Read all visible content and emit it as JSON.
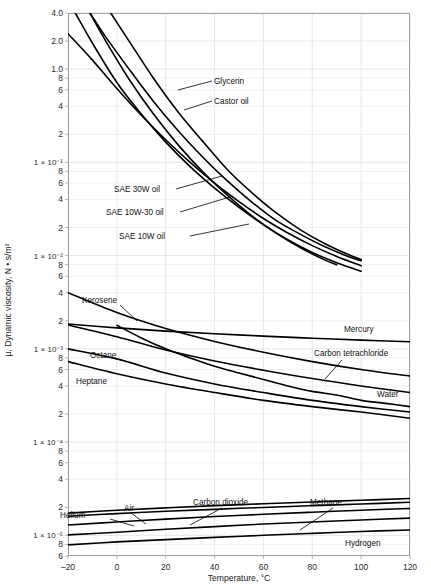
{
  "chart_data": {
    "type": "line",
    "title": "",
    "xlabel": "Temperature, °C",
    "ylabel": "μ, Dynamic viscosity, N • s/m²",
    "xlim": [
      -20,
      120
    ],
    "ylim": [
      6e-06,
      4.0
    ],
    "yscale": "log",
    "xscale": "linear",
    "grid": true,
    "legend_position": "inline-annotations",
    "x_ticks": [
      {
        "value": -20,
        "label": "–20"
      },
      {
        "value": 0,
        "label": "0"
      },
      {
        "value": 20,
        "label": "20"
      },
      {
        "value": 40,
        "label": "40"
      },
      {
        "value": 60,
        "label": "60"
      },
      {
        "value": 80,
        "label": "80"
      },
      {
        "value": 100,
        "label": "100"
      },
      {
        "value": 120,
        "label": "120"
      }
    ],
    "y_ticks": [
      {
        "value": 4.0,
        "label": "4.0",
        "major": true
      },
      {
        "value": 2.0,
        "label": "2.0",
        "major": true
      },
      {
        "value": 1.0,
        "label": "1.0",
        "major": true
      },
      {
        "value": 0.8,
        "label": "8",
        "major": false
      },
      {
        "value": 0.6,
        "label": "6",
        "major": false
      },
      {
        "value": 0.4,
        "label": "4",
        "major": false
      },
      {
        "value": 0.2,
        "label": "2",
        "major": false
      },
      {
        "value": 0.1,
        "label": "1 × 10⁻¹",
        "major": true
      },
      {
        "value": 0.08,
        "label": "8",
        "major": false
      },
      {
        "value": 0.06,
        "label": "6",
        "major": false
      },
      {
        "value": 0.04,
        "label": "4",
        "major": false
      },
      {
        "value": 0.02,
        "label": "2",
        "major": false
      },
      {
        "value": 0.01,
        "label": "1 × 10⁻²",
        "major": true
      },
      {
        "value": 0.008,
        "label": "8",
        "major": false
      },
      {
        "value": 0.006,
        "label": "6",
        "major": false
      },
      {
        "value": 0.004,
        "label": "4",
        "major": false
      },
      {
        "value": 0.002,
        "label": "2",
        "major": false
      },
      {
        "value": 0.001,
        "label": "1 × 10⁻³",
        "major": true
      },
      {
        "value": 0.0008,
        "label": "8",
        "major": false
      },
      {
        "value": 0.0006,
        "label": "6",
        "major": false
      },
      {
        "value": 0.0004,
        "label": "4",
        "major": false
      },
      {
        "value": 0.0002,
        "label": "2",
        "major": false
      },
      {
        "value": 0.0001,
        "label": "1 × 10⁻⁴",
        "major": true
      },
      {
        "value": 8e-05,
        "label": "8",
        "major": false
      },
      {
        "value": 6e-05,
        "label": "6",
        "major": false
      },
      {
        "value": 4e-05,
        "label": "4",
        "major": false
      },
      {
        "value": 2e-05,
        "label": "2",
        "major": false
      },
      {
        "value": 1e-05,
        "label": "1 × 10⁻⁵",
        "major": true
      },
      {
        "value": 8e-06,
        "label": "8",
        "major": false
      },
      {
        "value": 6e-06,
        "label": "6",
        "major": false
      }
    ],
    "series": [
      {
        "name": "Glycerin",
        "points": [
          [
            -2.5,
            4.0
          ],
          [
            5,
            2.0
          ],
          [
            15,
            0.8
          ],
          [
            25,
            0.35
          ],
          [
            35,
            0.17
          ],
          [
            45,
            0.085
          ],
          [
            55,
            0.048
          ],
          [
            65,
            0.029
          ],
          [
            75,
            0.019
          ],
          [
            85,
            0.0135
          ],
          [
            95,
            0.0102
          ],
          [
            100,
            0.0091
          ]
        ]
      },
      {
        "name": "Castor oil",
        "points": [
          [
            -11,
            4.0
          ],
          [
            -5,
            2.3
          ],
          [
            5,
            1.0
          ],
          [
            15,
            0.45
          ],
          [
            25,
            0.22
          ],
          [
            35,
            0.115
          ],
          [
            45,
            0.064
          ],
          [
            55,
            0.038
          ],
          [
            65,
            0.024
          ],
          [
            75,
            0.017
          ],
          [
            85,
            0.0125
          ],
          [
            95,
            0.0097
          ],
          [
            100,
            0.0088
          ]
        ]
      },
      {
        "name": "SAE 30W oil",
        "points": [
          [
            -20,
            2.4
          ],
          [
            -10,
            1.25
          ],
          [
            0,
            0.62
          ],
          [
            10,
            0.32
          ],
          [
            20,
            0.175
          ],
          [
            30,
            0.1
          ],
          [
            40,
            0.06
          ],
          [
            50,
            0.038
          ],
          [
            60,
            0.025
          ],
          [
            70,
            0.0175
          ],
          [
            80,
            0.0128
          ],
          [
            90,
            0.0098
          ],
          [
            100,
            0.0078
          ]
        ]
      },
      {
        "name": "SAE 10W-30 oil",
        "points": [
          [
            -17,
            4.0
          ],
          [
            -10,
            1.9
          ],
          [
            0,
            0.72
          ],
          [
            10,
            0.33
          ],
          [
            20,
            0.165
          ],
          [
            30,
            0.09
          ],
          [
            40,
            0.053
          ],
          [
            50,
            0.033
          ],
          [
            60,
            0.0215
          ],
          [
            70,
            0.0148
          ],
          [
            80,
            0.0108
          ],
          [
            90,
            0.0084
          ],
          [
            100,
            0.0068
          ]
        ]
      },
      {
        "name": "SAE 10W oil",
        "points": [
          [
            -11,
            4.0
          ],
          [
            -5,
            2.1
          ],
          [
            5,
            0.78
          ],
          [
            15,
            0.33
          ],
          [
            25,
            0.155
          ],
          [
            35,
            0.08
          ],
          [
            45,
            0.045
          ],
          [
            55,
            0.027
          ],
          [
            65,
            0.0175
          ],
          [
            75,
            0.0122
          ],
          [
            85,
            0.009
          ],
          [
            90,
            0.008
          ]
        ]
      },
      {
        "name": "Mercury",
        "points": [
          [
            -20,
            0.00185
          ],
          [
            0,
            0.00168
          ],
          [
            20,
            0.00155
          ],
          [
            40,
            0.00145
          ],
          [
            60,
            0.00137
          ],
          [
            80,
            0.0013
          ],
          [
            100,
            0.00124
          ],
          [
            120,
            0.00119
          ]
        ]
      },
      {
        "name": "Kerosene",
        "points": [
          [
            -20,
            0.004
          ],
          [
            0,
            0.00245
          ],
          [
            20,
            0.00165
          ],
          [
            40,
            0.0012
          ],
          [
            60,
            0.00092
          ],
          [
            80,
            0.00073
          ],
          [
            100,
            0.0006
          ],
          [
            120,
            0.00051
          ]
        ]
      },
      {
        "name": "Carbon tetrachloride",
        "points": [
          [
            -20,
            0.0018
          ],
          [
            0,
            0.00135
          ],
          [
            20,
            0.00097
          ],
          [
            40,
            0.00074
          ],
          [
            60,
            0.00059
          ],
          [
            80,
            0.00048
          ],
          [
            100,
            0.0004
          ],
          [
            120,
            0.00034
          ]
        ]
      },
      {
        "name": "Octane",
        "points": [
          [
            -20,
            0.001
          ],
          [
            0,
            0.00078
          ],
          [
            20,
            0.00055
          ],
          [
            40,
            0.00042
          ],
          [
            60,
            0.00034
          ],
          [
            80,
            0.00028
          ],
          [
            100,
            0.00024
          ],
          [
            120,
            0.00021
          ]
        ]
      },
      {
        "name": "Heptane",
        "points": [
          [
            -20,
            0.00073
          ],
          [
            0,
            0.00054
          ],
          [
            20,
            0.00042
          ],
          [
            40,
            0.00034
          ],
          [
            60,
            0.00028
          ],
          [
            80,
            0.00024
          ],
          [
            100,
            0.00021
          ],
          [
            120,
            0.00018
          ]
        ]
      },
      {
        "name": "Water",
        "points": [
          [
            0,
            0.00179
          ],
          [
            10,
            0.00131
          ],
          [
            20,
            0.001
          ],
          [
            30,
            0.0008
          ],
          [
            40,
            0.00065
          ],
          [
            50,
            0.00055
          ],
          [
            60,
            0.00047
          ],
          [
            70,
            0.0004
          ],
          [
            80,
            0.00035
          ],
          [
            90,
            0.00032
          ],
          [
            100,
            0.00028
          ],
          [
            110,
            0.00026
          ],
          [
            120,
            0.00024
          ]
        ]
      },
      {
        "name": "Methane",
        "points": [
          [
            -20,
            1.01e-05
          ],
          [
            0,
            1.08e-05
          ],
          [
            20,
            1.16e-05
          ],
          [
            40,
            1.24e-05
          ],
          [
            60,
            1.32e-05
          ],
          [
            80,
            1.39e-05
          ],
          [
            100,
            1.46e-05
          ],
          [
            120,
            1.53e-05
          ]
        ]
      },
      {
        "name": "Carbon dioxide",
        "points": [
          [
            -20,
            1.29e-05
          ],
          [
            0,
            1.39e-05
          ],
          [
            20,
            1.49e-05
          ],
          [
            40,
            1.59e-05
          ],
          [
            60,
            1.68e-05
          ],
          [
            80,
            1.77e-05
          ],
          [
            100,
            1.86e-05
          ],
          [
            120,
            1.94e-05
          ]
        ]
      },
      {
        "name": "Air",
        "points": [
          [
            -20,
            1.6e-05
          ],
          [
            0,
            1.71e-05
          ],
          [
            20,
            1.81e-05
          ],
          [
            40,
            1.9e-05
          ],
          [
            60,
            1.99e-05
          ],
          [
            80,
            2.08e-05
          ],
          [
            100,
            2.17e-05
          ],
          [
            120,
            2.26e-05
          ]
        ]
      },
      {
        "name": "Helium",
        "points": [
          [
            -20,
            1.73e-05
          ],
          [
            0,
            1.86e-05
          ],
          [
            20,
            1.97e-05
          ],
          [
            40,
            2.08e-05
          ],
          [
            60,
            2.18e-05
          ],
          [
            80,
            2.28e-05
          ],
          [
            100,
            2.38e-05
          ],
          [
            120,
            2.48e-05
          ]
        ]
      },
      {
        "name": "Hydrogen",
        "points": [
          [
            -20,
            7.9e-06
          ],
          [
            0,
            8.5e-06
          ],
          [
            20,
            9e-06
          ],
          [
            40,
            9.5e-06
          ],
          [
            60,
            1e-05
          ],
          [
            80,
            1.05e-05
          ],
          [
            100,
            1.1e-05
          ],
          [
            120,
            1.14e-05
          ]
        ]
      }
    ],
    "annotations": [
      {
        "text": "Glycerin",
        "x": 214,
        "y": 84,
        "anchor": "start"
      },
      {
        "text": "Castor oil",
        "x": 214,
        "y": 104,
        "anchor": "start"
      },
      {
        "text": "SAE 30W oil",
        "x": 114,
        "y": 192,
        "anchor": "start"
      },
      {
        "text": "SAE 10W-30 oil",
        "x": 106,
        "y": 215,
        "anchor": "start"
      },
      {
        "text": "SAE 10W oil",
        "x": 119,
        "y": 239,
        "anchor": "start"
      },
      {
        "text": "Kerosene",
        "x": 82,
        "y": 303,
        "anchor": "start"
      },
      {
        "text": "Mercury",
        "x": 344,
        "y": 332,
        "anchor": "start"
      },
      {
        "text": "Carbon tetrachloride",
        "x": 314,
        "y": 356,
        "anchor": "start"
      },
      {
        "text": "Octane",
        "x": 90,
        "y": 358,
        "anchor": "start"
      },
      {
        "text": "Heptane",
        "x": 76,
        "y": 384,
        "anchor": "start"
      },
      {
        "text": "Water",
        "x": 377,
        "y": 397,
        "anchor": "start"
      },
      {
        "text": "Helium",
        "x": 60,
        "y": 518,
        "anchor": "start"
      },
      {
        "text": "Air",
        "x": 124,
        "y": 511,
        "anchor": "start"
      },
      {
        "text": "Carbon dioxide",
        "x": 193,
        "y": 505,
        "anchor": "start"
      },
      {
        "text": "Methane",
        "x": 310,
        "y": 505,
        "anchor": "start"
      },
      {
        "text": "Hydrogen",
        "x": 345,
        "y": 546,
        "anchor": "start"
      }
    ],
    "leader_lines": [
      {
        "from": [
          212,
          81
        ],
        "to": [
          178,
          90
        ]
      },
      {
        "from": [
          212,
          101
        ],
        "to": [
          184,
          110
        ]
      },
      {
        "from": [
          176,
          189
        ],
        "to": [
          222,
          176
        ]
      },
      {
        "from": [
          180,
          212
        ],
        "to": [
          233,
          196
        ]
      },
      {
        "from": [
          190,
          236
        ],
        "to": [
          249,
          224
        ]
      },
      {
        "from": [
          120,
          305
        ],
        "to": [
          137,
          321
        ]
      },
      {
        "from": [
          342,
          360
        ],
        "to": [
          325,
          379
        ]
      },
      {
        "from": [
          110,
          519
        ],
        "to": [
          134,
          526
        ]
      },
      {
        "from": [
          131,
          513
        ],
        "to": [
          146,
          524
        ]
      },
      {
        "from": [
          222,
          508
        ],
        "to": [
          190,
          525
        ]
      },
      {
        "from": [
          333,
          508
        ],
        "to": [
          300,
          530
        ]
      }
    ]
  },
  "plot": {
    "frame": {
      "left": 68,
      "top": 13,
      "right": 410,
      "bottom": 556
    },
    "colors": {
      "curve": "#000000",
      "grid": "#d8dde3",
      "frame": "#9aa1a8",
      "text": "#1a1a1a",
      "background": "#ffffff"
    }
  }
}
